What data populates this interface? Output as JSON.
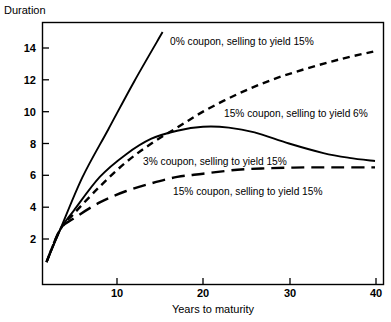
{
  "chart_data": {
    "type": "line",
    "title": "",
    "ylabel": "Duration",
    "xlabel": "Years to maturity",
    "xlim": [
      1.3,
      40
    ],
    "ylim": [
      0,
      15.2
    ],
    "xticks": [
      10,
      20,
      30,
      40
    ],
    "yticks": [
      2,
      4,
      6,
      8,
      10,
      12,
      14
    ],
    "grid": false,
    "legend_position": "inline-annotations",
    "series": [
      {
        "name": "0% coupon, selling to yield 15%",
        "style": "solid",
        "x": [
          1.8,
          3.4,
          6,
          9,
          12,
          15.3
        ],
        "values": [
          0.55,
          2.6,
          5.9,
          8.9,
          11.9,
          15.0
        ]
      },
      {
        "name": "15% coupon, selling to yield 6%",
        "style": "short-dash",
        "x": [
          1.8,
          3.4,
          5,
          8,
          11,
          14,
          17,
          20,
          24,
          28,
          32,
          36,
          40
        ],
        "values": [
          0.55,
          2.6,
          3.6,
          5.3,
          6.8,
          8.0,
          9.0,
          10.0,
          11.1,
          12.0,
          12.7,
          13.3,
          13.8
        ]
      },
      {
        "name": "3% coupon, selling to yield 15%",
        "style": "solid",
        "x": [
          1.8,
          3.4,
          5,
          8,
          11,
          14,
          17,
          20,
          23,
          26,
          30,
          34,
          37,
          40
        ],
        "values": [
          0.55,
          2.6,
          3.8,
          5.9,
          7.3,
          8.3,
          8.8,
          9.05,
          9.0,
          8.7,
          8.0,
          7.4,
          7.1,
          6.9
        ]
      },
      {
        "name": "15% coupon, selling to yield 15%",
        "style": "long-dash",
        "x": [
          1.8,
          3.4,
          5,
          8,
          11,
          14,
          17,
          20,
          24,
          28,
          32,
          36,
          40
        ],
        "values": [
          0.55,
          2.6,
          3.3,
          4.3,
          5.0,
          5.5,
          5.9,
          6.1,
          6.35,
          6.45,
          6.5,
          6.5,
          6.5
        ]
      }
    ],
    "annotations": [
      {
        "text": "0% coupon, selling to yield 15%",
        "x_px": 170,
        "y_px": 45
      },
      {
        "text": "15% coupon, selling to yield 6%",
        "x_px": 224,
        "y_px": 117
      },
      {
        "text": "3% coupon, selling to yield 15%",
        "x_px": 143,
        "y_px": 165
      },
      {
        "text": "15% coupon, selling to yield 15%",
        "x_px": 173,
        "y_px": 195
      }
    ]
  },
  "axes": {
    "y_title": "Duration",
    "x_title": "Years to maturity",
    "y_tick_labels": [
      "14",
      "12",
      "10",
      "8",
      "6",
      "4",
      "2"
    ],
    "x_tick_labels": [
      "10",
      "20",
      "30",
      "40"
    ]
  },
  "colors": {
    "ink": "#000000",
    "background": "#ffffff"
  }
}
